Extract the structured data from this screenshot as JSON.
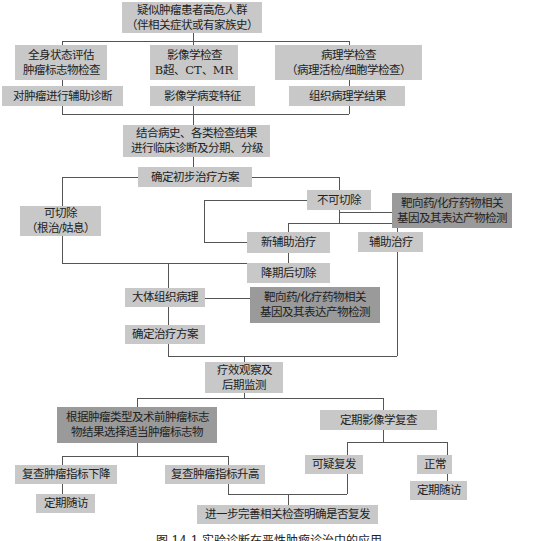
{
  "diagram": {
    "type": "flowchart",
    "title_caption": "图 14-1  实验诊断在恶性肿瘤诊治中的应用",
    "colors": {
      "light_box": "#c8c8c8",
      "dark_box": "#9a9a9a",
      "connector": "#555555",
      "text": "#222222"
    },
    "nodes": {
      "start": {
        "line1": "疑似肿瘤患者高危人群",
        "line2": "（伴相关症状或有家族史）"
      },
      "exam_general": {
        "line1": "全身状态评估",
        "line2": "肿瘤标志物检查"
      },
      "exam_imaging": {
        "line1": "影像学检查",
        "line2": "B超、CT、MR"
      },
      "exam_pathology": {
        "line1": "病理学检查",
        "line2": "（病理活检/细胞学检查）"
      },
      "result_general": {
        "label": "对肿瘤进行辅助诊断"
      },
      "result_imaging": {
        "label": "影像学病变特征"
      },
      "result_pathology": {
        "label": "组织病理学结果"
      },
      "diagnosis": {
        "line1": "结合病史、各类检查结果",
        "line2": "进行临床诊断及分期、分级"
      },
      "initial_plan": {
        "label": "确定初步治疗方案"
      },
      "resectable": {
        "line1": "可切除",
        "line2": "（根治/姑息）"
      },
      "unresectable": {
        "label": "不可切除"
      },
      "gene_test_1": {
        "line1": "靶向药/化疗药物相关",
        "line2": "基因及其表达产物检测"
      },
      "neoadjuvant": {
        "label": "新辅助治疗"
      },
      "adjuvant": {
        "label": "辅助治疗"
      },
      "downstage_resection": {
        "label": "降期后切除"
      },
      "gross_pathology": {
        "label": "大体组织病理"
      },
      "gene_test_2": {
        "line1": "靶向药/化疗药物相关",
        "line2": "基因及其表达产物检测"
      },
      "final_plan": {
        "label": "确定治疗方案"
      },
      "monitoring": {
        "line1": "疗效观察及",
        "line2": "后期监测"
      },
      "marker_select": {
        "line1": "根据肿瘤类型及术前肿瘤标志",
        "line2": "物结果选择适当肿瘤标志物"
      },
      "imaging_followup": {
        "label": "定期影像学复查"
      },
      "marker_down": {
        "label": "复查肿瘤指标下降"
      },
      "marker_up": {
        "label": "复查肿瘤指标升高"
      },
      "suspected_recurrence": {
        "label": "可疑复发"
      },
      "normal": {
        "label": "正常"
      },
      "followup_left": {
        "label": "定期随访"
      },
      "followup_right": {
        "label": "定期随访"
      },
      "further_exam": {
        "label": "进一步完善相关检查明确是否复发"
      }
    }
  }
}
